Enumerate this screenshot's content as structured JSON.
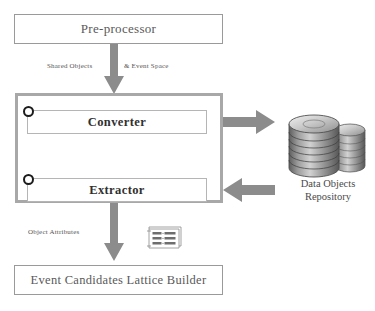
{
  "diagram": {
    "nodes": {
      "preprocessor": {
        "label": "Pre-processor"
      },
      "converter": {
        "label": "Converter"
      },
      "extractor": {
        "label": "Extractor"
      },
      "lattice_builder": {
        "label": "Event Candidates Lattice Builder"
      },
      "repository": {
        "label_line1": "Data Objects",
        "label_line2": "Repository"
      }
    },
    "edge_labels": {
      "shared_objects": "Shared Objects",
      "event_space": "& Event Space",
      "object_attributes": "Object Attributes"
    },
    "attribute_icon": {
      "rows": [
        {
          "id": "ID1",
          "sep": ":",
          "value": "Time"
        },
        {
          "id": "ID4",
          "sep": ":",
          "value": "Sec"
        },
        {
          "id": "ID6",
          "sep": ":",
          "value": "Date"
        }
      ]
    },
    "colors": {
      "container_border": "#a8a8a8",
      "box_border": "#9a9a9a",
      "arrow_fill": "#8c8c8c",
      "text_primary": "#303030",
      "text_muted": "#555555",
      "repository_body": "#8f8f8f"
    }
  }
}
